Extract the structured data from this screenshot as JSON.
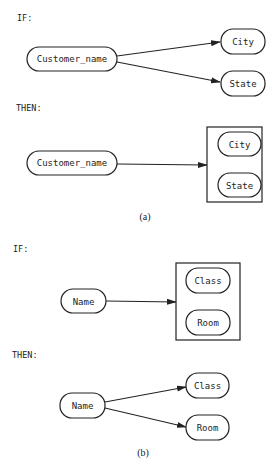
{
  "figure_a": {
    "if_label": "IF:",
    "then_label": "THEN:",
    "caption": "(a)",
    "if_nodes": {
      "source": "Customer_name",
      "target1": "City",
      "target2": "State"
    },
    "then_nodes": {
      "source": "Customer_name",
      "group_item1": "City",
      "group_item2": "State"
    }
  },
  "figure_b": {
    "if_label": "IF:",
    "then_label": "THEN:",
    "caption": "(b)",
    "if_nodes": {
      "source": "Name",
      "group_item1": "Class",
      "group_item2": "Room"
    },
    "then_nodes": {
      "source": "Name",
      "target1": "Class",
      "target2": "Room"
    }
  }
}
